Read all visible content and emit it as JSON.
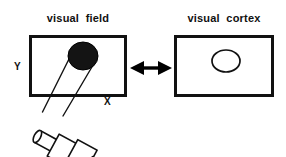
{
  "figure": {
    "background_color": "#ffffff",
    "ink_color": "#000000",
    "width": 286,
    "height": 157,
    "panels": [
      {
        "id": "visual-field",
        "title": "visual  field",
        "box": {
          "x": 30,
          "y": 36,
          "width": 95,
          "height": 59
        },
        "axis_labels": {
          "x": "X",
          "y": "Y"
        },
        "stimulus": {
          "name": "filled-ellipse",
          "fill": "#111111",
          "stroke": "#000000",
          "cx": 83,
          "cy": 56,
          "rx": 15,
          "ry": 14
        }
      },
      {
        "id": "visual-cortex",
        "title": "visual  cortex",
        "box": {
          "x": 175,
          "y": 36,
          "width": 97,
          "height": 59
        },
        "axis_labels": {
          "x": "",
          "y": ""
        },
        "stimulus": {
          "name": "outline-ellipse",
          "fill": "none",
          "stroke": "#111111",
          "cx": 226,
          "cy": 61,
          "rx": 14,
          "ry": 11
        }
      }
    ],
    "connector": {
      "name": "double-headed-arrow",
      "label": "",
      "x_start": 131,
      "x_end": 171,
      "y": 68,
      "color": "#000000"
    },
    "projector": {
      "name": "light-stimulator",
      "description": "hand-held light projector aimed at the visual field",
      "beam": {
        "color": "#111111",
        "left_line": {
          "x1": 70,
          "y1": 59,
          "x2": 43,
          "y2": 111
        },
        "right_line": {
          "x1": 92,
          "y1": 66,
          "x2": 63,
          "y2": 115
        }
      }
    }
  }
}
